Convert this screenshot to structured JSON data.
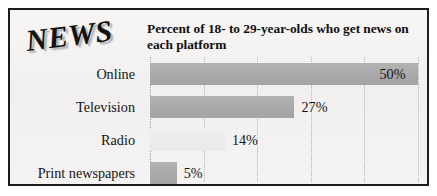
{
  "logo": {
    "text": "NEWS"
  },
  "chart_data": {
    "type": "bar",
    "orientation": "horizontal",
    "title": "Percent of 18- to 29-year-olds who get news on each platform",
    "xlabel": "",
    "ylabel": "",
    "xlim": [
      0,
      55
    ],
    "grid": true,
    "gridlines_at": [
      0,
      10,
      20,
      30,
      40,
      50
    ],
    "legend": "none",
    "categories": [
      "Online",
      "Television",
      "Radio",
      "Print newspapers"
    ],
    "values": [
      50,
      27,
      14,
      5
    ],
    "value_labels": [
      "50%",
      "27%",
      "14%",
      "5%"
    ],
    "bars": [
      {
        "category": "Online",
        "value": 50,
        "label": "50%",
        "label_inside": true,
        "faint": false,
        "color": "#acacac"
      },
      {
        "category": "Television",
        "value": 27,
        "label": "27%",
        "label_inside": false,
        "faint": false,
        "color": "#acacac"
      },
      {
        "category": "Radio",
        "value": 14,
        "label": "14%",
        "label_inside": false,
        "faint": true,
        "color": "#ececea"
      },
      {
        "category": "Print newspapers",
        "value": 5,
        "label": "5%",
        "label_inside": false,
        "faint": false,
        "color": "#acacac"
      }
    ]
  },
  "colors": {
    "bar": "#acacac",
    "bar_faint": "#ececea",
    "background": "#f4f3f1",
    "frame": "#1d1d1d",
    "gridline": "#b4b4b4",
    "text": "#101010"
  }
}
